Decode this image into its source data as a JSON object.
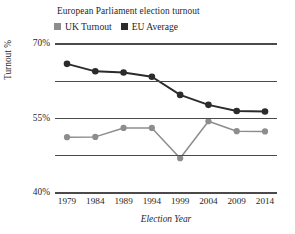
{
  "chart_data": {
    "type": "line",
    "title": "European Parliament election turnout",
    "xlabel": "Election Year",
    "ylabel": "Turnout %",
    "categories": [
      "1979",
      "1984",
      "1989",
      "1994",
      "1999",
      "2004",
      "2009",
      "2014"
    ],
    "ylim": [
      10,
      70
    ],
    "yticks": [
      "10%",
      "25%",
      "40%",
      "55%",
      "70%"
    ],
    "ytick_values": [
      10,
      25,
      40,
      55,
      70
    ],
    "grid": true,
    "legend_position": "top-left",
    "series": [
      {
        "name": "UK Turnout",
        "color": "#8d8d8d",
        "values": [
          32.5,
          32.6,
          36.2,
          36.2,
          24.0,
          38.9,
          34.9,
          34.8
        ]
      },
      {
        "name": "EU Average",
        "color": "#2b2b2b",
        "values": [
          62.0,
          59.0,
          58.5,
          56.8,
          49.5,
          45.5,
          43.0,
          42.8
        ]
      }
    ]
  },
  "legend": {
    "items": [
      {
        "label": "UK Turnout",
        "swatch": "#8d8d8d"
      },
      {
        "label": "EU Average",
        "swatch": "#2b2b2b"
      }
    ]
  }
}
